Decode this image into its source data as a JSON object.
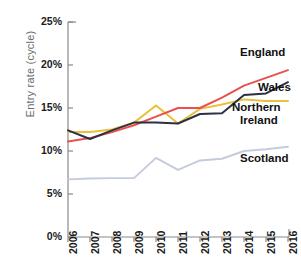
{
  "chart_data": {
    "type": "line",
    "title": "",
    "subtitle": "",
    "xlabel": "",
    "ylabel": "Entry rate (cycle)",
    "x": [
      2006,
      2007,
      2008,
      2009,
      2010,
      2011,
      2012,
      2013,
      2014,
      2015,
      2016
    ],
    "categories": [
      "2006",
      "2007",
      "2008",
      "2009",
      "2010",
      "2011",
      "2012",
      "2013",
      "2014",
      "2015",
      "2016"
    ],
    "xlim": [
      2006,
      2016
    ],
    "ylim": [
      0,
      25
    ],
    "yticks": [
      0,
      5,
      10,
      15,
      20,
      25
    ],
    "ytick_labels": [
      "0%",
      "5%",
      "10%",
      "15%",
      "20%",
      "25%"
    ],
    "grid": false,
    "legend_position": "inline-right-of-line-ends",
    "series": [
      {
        "name": "England",
        "color": "#e8524a",
        "values": [
          11.1,
          11.5,
          12.2,
          13.0,
          14.0,
          15.0,
          15.0,
          16.2,
          17.6,
          18.5,
          19.4
        ]
      },
      {
        "name": "Wales",
        "color": "#2b3044",
        "values": [
          12.4,
          11.4,
          12.4,
          13.3,
          13.3,
          13.2,
          14.3,
          14.4,
          16.5,
          16.7,
          18.0
        ]
      },
      {
        "name": "Northern Ireland",
        "color": "#e8c13c",
        "values": [
          12.2,
          12.2,
          12.5,
          13.3,
          15.3,
          13.2,
          14.9,
          15.4,
          16.0,
          15.8,
          15.8
        ]
      },
      {
        "name": "Scotland",
        "color": "#c5cbde",
        "values": [
          6.7,
          6.8,
          6.85,
          6.85,
          9.2,
          7.8,
          8.9,
          9.1,
          10.0,
          10.2,
          10.5
        ]
      }
    ],
    "annotations": [
      {
        "text": "England",
        "series": "England"
      },
      {
        "text": "Wales",
        "series": "Wales"
      },
      {
        "text": "Northern",
        "series": "Northern Ireland"
      },
      {
        "text": "Ireland",
        "series": "Northern Ireland"
      },
      {
        "text": "Scotland",
        "series": "Scotland"
      }
    ]
  },
  "axes": {
    "ylabel": "Entry rate (cycle)",
    "ytick_labels": [
      "25%",
      "20%",
      "15%",
      "10%",
      "5%",
      "0%"
    ],
    "xtick_labels": [
      "2006",
      "2007",
      "2008",
      "2009",
      "2010",
      "2011",
      "2012",
      "2013",
      "2014",
      "2015",
      "2016"
    ]
  },
  "labels": {
    "england": "England",
    "wales": "Wales",
    "northern": "Northern",
    "ireland": "Ireland",
    "scotland": "Scotland"
  },
  "colors": {
    "england": "#e8524a",
    "wales": "#2b3044",
    "northern_ireland": "#e8c13c",
    "scotland": "#c5cbde",
    "axis": "#8a8a8a",
    "tick_text": "#1b1b1b",
    "axis_label_text": "#6b6b6b"
  }
}
